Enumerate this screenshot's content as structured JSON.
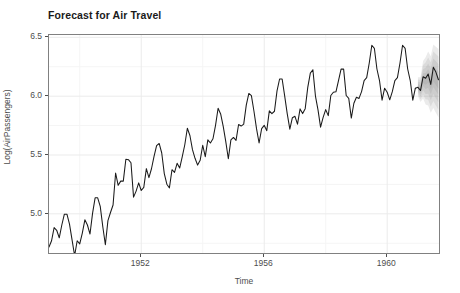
{
  "title": "Forecast for Air Travel",
  "axes": {
    "xlabel": "Time",
    "ylabel": "Log(AirPassengers)",
    "xticks": [
      "1952",
      "1956",
      "1960"
    ],
    "yticks": [
      "6.5",
      "6.0",
      "5.5",
      "5.0"
    ]
  },
  "colors": {
    "line": "#1a1a1a",
    "ribbon": "#9a9a9a",
    "panel_border": "#808080",
    "grid_major": "#ebebeb",
    "grid_minor": "#f5f5f5",
    "text": "#4d4d4d",
    "title": "#1a1a1a",
    "panel_background": "#ffffff"
  },
  "chart_data": {
    "type": "line",
    "title": "Forecast for Air Travel",
    "xlabel": "Time",
    "ylabel": "Log(AirPassengers)",
    "xlim": [
      1949.0,
      1961.75
    ],
    "ylim": [
      4.65,
      6.52
    ],
    "grid": true,
    "legend": "none",
    "xtick_values": [
      1952,
      1956,
      1960
    ],
    "ytick_values": [
      5.0,
      5.5,
      6.0,
      6.5
    ],
    "x_minor_gridlines": [
      1950,
      1954,
      1958
    ],
    "y_minor_gridlines": [
      4.75,
      5.25,
      5.75,
      6.25
    ],
    "series": [
      {
        "name": "Log(AirPassengers) observed",
        "x_start": 1949.0,
        "x_step": 0.08333,
        "n": 144,
        "values": [
          4.718,
          4.771,
          4.883,
          4.86,
          4.796,
          4.905,
          4.997,
          4.997,
          4.913,
          4.779,
          4.644,
          4.771,
          4.745,
          4.836,
          4.949,
          4.905,
          4.828,
          5.004,
          5.136,
          5.136,
          5.063,
          4.89,
          4.737,
          4.942,
          5.011,
          5.075,
          5.347,
          5.242,
          5.278,
          5.278,
          5.464,
          5.46,
          5.434,
          5.142,
          5.193,
          5.263,
          5.198,
          5.225,
          5.384,
          5.308,
          5.383,
          5.489,
          5.58,
          5.598,
          5.517,
          5.342,
          5.252,
          5.22,
          5.375,
          5.352,
          5.429,
          5.389,
          5.484,
          5.587,
          5.727,
          5.666,
          5.545,
          5.472,
          5.414,
          5.455,
          5.583,
          5.486,
          5.629,
          5.602,
          5.638,
          5.752,
          5.897,
          5.849,
          5.744,
          5.613,
          5.468,
          5.628,
          5.649,
          5.624,
          5.759,
          5.746,
          5.762,
          5.924,
          6.023,
          6.004,
          5.872,
          5.724,
          5.602,
          5.724,
          5.752,
          5.707,
          5.875,
          5.852,
          5.872,
          6.045,
          6.146,
          6.146,
          6.001,
          5.849,
          5.72,
          5.817,
          5.829,
          5.762,
          5.892,
          5.852,
          5.894,
          6.075,
          6.196,
          6.225,
          6.001,
          5.884,
          5.737,
          5.82,
          5.886,
          5.835,
          6.006,
          6.033,
          6.037,
          6.133,
          6.23,
          6.23,
          6.006,
          5.981,
          5.814,
          5.94,
          5.991,
          5.981,
          6.039,
          6.133,
          6.157,
          6.282,
          6.433,
          6.407,
          6.231,
          6.133,
          5.966,
          6.068,
          6.033,
          5.969,
          6.038,
          6.133,
          6.157,
          6.282,
          6.433,
          6.407,
          6.231,
          6.133,
          5.966,
          6.068
        ]
      },
      {
        "name": "Forecast mean",
        "x_start": 1961.0,
        "x_step": 0.08333,
        "n": 9,
        "values": [
          6.075,
          6.048,
          6.165,
          6.152,
          6.188,
          6.1,
          6.245,
          6.205,
          6.14
        ]
      }
    ],
    "ribbon": {
      "name": "Prediction interval",
      "x_start": 1961.0,
      "x_step": 0.08333,
      "n": 9,
      "lower": [
        6.0,
        5.95,
        5.98,
        5.93,
        5.92,
        5.86,
        5.9,
        5.86,
        5.82
      ],
      "upper": [
        6.16,
        6.16,
        6.3,
        6.33,
        6.38,
        6.34,
        6.44,
        6.42,
        6.4
      ]
    }
  }
}
